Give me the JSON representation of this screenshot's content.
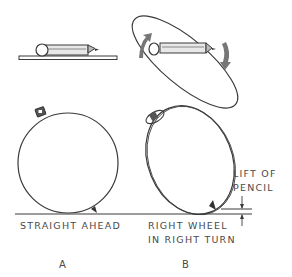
{
  "figure": {
    "labels": {
      "straight_ahead": "STRAIGHT AHEAD",
      "right_wheel_line1": "RIGHT WHEEL",
      "right_wheel_line2": "IN RIGHT TURN",
      "lift_line1": "LIFT OF",
      "lift_line2": "PENCIL"
    },
    "captions": {
      "a": "A",
      "b": "B"
    },
    "icons": {
      "pencil_flat": "pencil-on-plate",
      "pencil_rotated": "pencil-in-tilted-ellipse",
      "rotation_arrows": "curved-rotation-arrows"
    },
    "colors": {
      "line": "#3a3a3a",
      "text": "#4a4a4a",
      "background": "#ffffff"
    }
  }
}
